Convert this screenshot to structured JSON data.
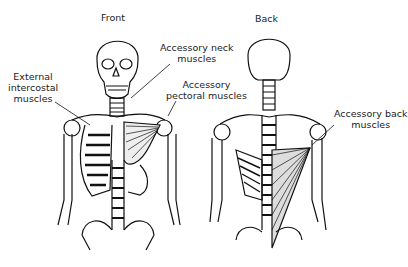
{
  "views": {
    "front": {
      "title": "Front"
    },
    "back": {
      "title": "Back"
    }
  },
  "labels": {
    "external_intercostal": [
      "External",
      "intercostal",
      "muscles"
    ],
    "accessory_neck": [
      "Accessory neck",
      "muscles"
    ],
    "accessory_pectoral": [
      "Accessory",
      "pectoral muscles"
    ],
    "accessory_back": [
      "Accessory back",
      "muscles"
    ]
  }
}
